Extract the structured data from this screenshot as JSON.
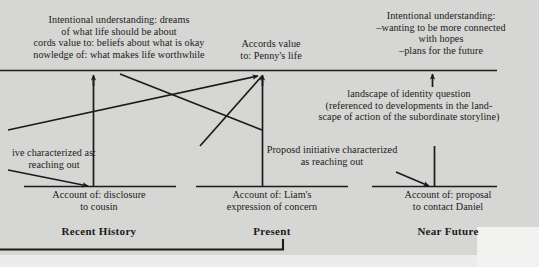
{
  "figure": {
    "background_color": "#d6d6d4",
    "ink_color": "#1b1b1b"
  },
  "annotations": {
    "intentional_left": "Intentional understanding: dreams\nof what life should be about\ncords value to: beliefs about what is okay\nnowledge of: what makes life worthwhile",
    "accords_penny": "Accords value\nto: Penny's life",
    "intentional_right": "Intentional understanding:\n–wanting to be more connected\nwith hopes\n–plans for the future",
    "landscape_identity": "landscape of identity question\n(referenced to developments in the land-\nscape of action of the subordinate storyline)",
    "characterized_left": "ive characterized as:\nreaching out",
    "proposd_initiative": "Proposd initiative characterized\nas reaching out"
  },
  "accounts": {
    "disclosure": "Account of: disclosure\nto cousin",
    "liam": "Account of: Liam's\nexpression of concern",
    "proposal": "Account of: proposal\nto contact Daniel"
  },
  "periods": {
    "recent_history": "Recent History",
    "present": "Present",
    "near_future": "Near Future"
  }
}
